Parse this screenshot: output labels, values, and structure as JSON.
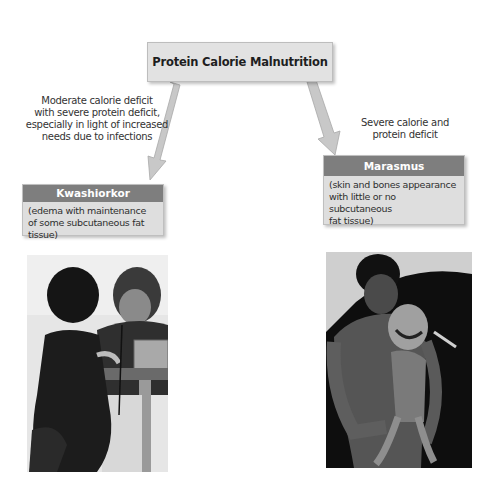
{
  "diagram": {
    "title": "Protein Calorie Malnutrition",
    "branches": [
      {
        "arrow_caption": "Moderate calorie deficit with severe protein deficit, especially in light of increased needs due to infections",
        "arrow_caption_lines": [
          "Moderate calorie deficit",
          "with severe protein deficit,",
          "especially in light of increased",
          "needs due to infections"
        ],
        "category": "Kwashiorkor",
        "description_lines": [
          "(edema with maintenance",
          "of some subcutaneous fat",
          "tissue)"
        ],
        "photo": "Photograph of a child with kwashiorkor being examined with a stethoscope by a health worker"
      },
      {
        "arrow_caption": "Severe calorie and protein deficit",
        "arrow_caption_lines": [
          "Severe calorie and",
          "protein deficit"
        ],
        "category": "Marasmus",
        "description_lines": [
          "(skin and bones appearance",
          "with little or no subcutaneous",
          "fat tissue)"
        ],
        "photo": "Photograph of an emaciated adult holding a child with marasmus"
      }
    ],
    "colors": {
      "box_fill": "#e2e2e2",
      "header_fill": "#7e7e7e",
      "arrow_fill": "#c8c8c8",
      "text": "#2a2a2a"
    }
  }
}
